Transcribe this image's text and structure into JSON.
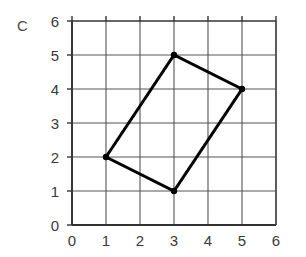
{
  "figure": {
    "panel_label": "C",
    "background_color": "#ffffff"
  },
  "chart_data": {
    "type": "scatter",
    "title": "C",
    "xlabel": "",
    "ylabel": "",
    "xlim": [
      0,
      6
    ],
    "ylim": [
      0,
      6
    ],
    "grid": true,
    "legend": null,
    "x_ticks": [
      "0",
      "1",
      "2",
      "3",
      "4",
      "5",
      "6"
    ],
    "y_ticks": [
      "0",
      "1",
      "2",
      "3",
      "4",
      "5",
      "6"
    ],
    "x_tick_values": [
      0,
      1,
      2,
      3,
      4,
      5,
      6
    ],
    "y_tick_values": [
      0,
      1,
      2,
      3,
      4,
      5,
      6
    ],
    "series": [
      {
        "name": "quadrilateral",
        "closed": true,
        "marker": "dot",
        "color": "#000000",
        "line_width": 3,
        "points": [
          {
            "x": 1,
            "y": 2
          },
          {
            "x": 3,
            "y": 5
          },
          {
            "x": 5,
            "y": 4
          },
          {
            "x": 3,
            "y": 1
          }
        ]
      }
    ],
    "annotations": []
  },
  "style": {
    "grid_color": "#555555",
    "axis_color": "#333333",
    "shape_color": "#000000",
    "tick_label_color": "#3a3a3a"
  }
}
